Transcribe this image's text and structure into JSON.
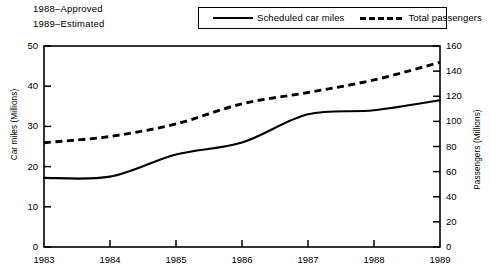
{
  "notes": {
    "approved": "1988–Approved",
    "estimated": "1989–Estimated"
  },
  "legend": {
    "items": [
      {
        "label": "Scheduled car miles",
        "style": "solid"
      },
      {
        "label": "Total passengers",
        "style": "dashed"
      }
    ]
  },
  "chart_data": {
    "type": "line",
    "title": "",
    "xlabel": "",
    "ylabel": "Car miles (Millions)",
    "y2label": "Passengers (Millions)",
    "x": [
      1983,
      1984,
      1985,
      1986,
      1987,
      1988,
      1989
    ],
    "xticklabels": [
      "1983",
      "1984",
      "1985",
      "1986",
      "1987",
      "1988",
      "1989"
    ],
    "xlim": [
      1983,
      1989
    ],
    "ylim": [
      0,
      50
    ],
    "yticks": [
      0,
      10,
      20,
      30,
      40,
      50
    ],
    "yticklabels": [
      "0",
      "10",
      "20",
      "30",
      "40",
      "50"
    ],
    "y2lim": [
      0,
      160
    ],
    "y2ticks": [
      0,
      20,
      40,
      60,
      80,
      100,
      120,
      140,
      160
    ],
    "y2ticklabels": [
      "0",
      "20",
      "40",
      "60",
      "80",
      "100",
      "120",
      "140",
      "160"
    ],
    "grid": false,
    "legend_position": "top-right",
    "series": [
      {
        "name": "Scheduled car miles",
        "axis": "left",
        "style": "solid",
        "units": "Millions",
        "values": [
          17.2,
          17.5,
          23.0,
          26.0,
          33.0,
          34.0,
          36.5
        ]
      },
      {
        "name": "Total passengers",
        "axis": "right",
        "style": "dashed",
        "units": "Millions",
        "values": [
          83,
          88,
          98,
          114,
          123,
          133,
          147
        ]
      }
    ],
    "annotations": [
      "1988–Approved",
      "1989–Estimated"
    ]
  }
}
